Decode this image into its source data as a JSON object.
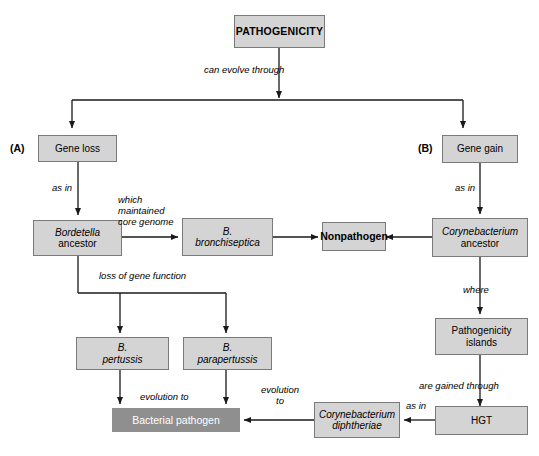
{
  "diagram": {
    "title": "PATHOGENICITY",
    "nodes": {
      "pathogenicity": "PATHOGENICITY",
      "gene_loss": "Gene loss",
      "gene_gain": "Gene gain",
      "bordetella_ancestor_line1": "Bordetella",
      "bordetella_ancestor_line2": "ancestor",
      "b_bronchiseptica_line1": "B.",
      "b_bronchiseptica_line2": "bronchiseptica",
      "nonpathogen": "Nonpathogen",
      "corynebacterium_ancestor_line1": "Corynebacterium",
      "corynebacterium_ancestor_line2": "ancestor",
      "b_pertussis_line1": "B.",
      "b_pertussis_line2": "pertussis",
      "b_parapertussis_line1": "B.",
      "b_parapertussis_line2": "parapertussis",
      "pathogenicity_islands_line1": "Pathogenicity",
      "pathogenicity_islands_line2": "islands",
      "bacterial_pathogen": "Bacterial pathogen",
      "c_diphtheriae_line1": "Corynebacterium",
      "c_diphtheriae_line2": "diphtheriae",
      "hgt": "HGT"
    },
    "panel_tags": {
      "a": "(A)",
      "b": "(B)"
    },
    "edge_labels": {
      "can_evolve_through": "can evolve through",
      "as_in_left": "as in",
      "as_in_right": "as in",
      "which_maintained_line1": "which",
      "which_maintained_line2": "maintained",
      "which_maintained_line3": "core genome",
      "loss_of_gene_function": "loss of gene function",
      "where": "where",
      "are_gained_through": "are gained through",
      "evolution_to_left": "evolution to",
      "evolution_to_right_line1": "evolution",
      "evolution_to_right_line2": "to",
      "as_in_hgt": "as in"
    },
    "colors": {
      "node_fill": "#d4d4d4",
      "node_border": "#7a7a7a",
      "highlight_fill": "#8f8f8f",
      "highlight_text": "#ffffff",
      "line": "#1a1a1a",
      "background": "#ffffff"
    }
  }
}
